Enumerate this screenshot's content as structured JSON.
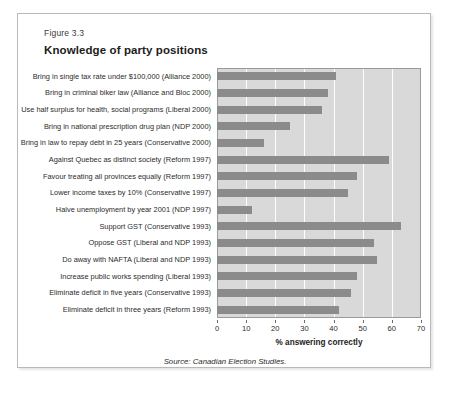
{
  "figure": {
    "number_label": "Figure 3.3",
    "title": "Knowledge of party positions",
    "source": "Source: Canadian Election Studies."
  },
  "colors": {
    "bar": "#8b8b8b",
    "plot_background": "#d9d9d9",
    "gridline": "#ffffff",
    "frame": "#9a9a9a",
    "card_border": "#b9b9b9",
    "text": "#231f20"
  },
  "chart_data": {
    "type": "bar",
    "orientation": "horizontal",
    "title": "Knowledge of party positions",
    "xlabel": "% answering correctly",
    "ylabel": "",
    "xlim": [
      0,
      70
    ],
    "xticks": [
      0,
      10,
      20,
      30,
      40,
      50,
      60,
      70
    ],
    "grid": true,
    "legend": null,
    "categories": [
      "Bring in single tax rate under $100,000 (Alliance 2000)",
      "Bring in criminal biker law (Alliance and Bloc 2000)",
      "Use half surplus for health, social programs (Liberal  2000)",
      "Bring in national prescription drug plan (NDP  2000)",
      "Bring in law to repay debt in 25 years (Conservative  2000)",
      "Against Quebec as distinct society (Reform 1997)",
      "Favour treating all provinces equally (Reform 1997)",
      "Lower income taxes by 10% (Conservative 1997)",
      "Halve unemployment by year 2001 (NDP 1997)",
      "Support GST (Conservative 1993)",
      "Oppose GST (Liberal and NDP 1993)",
      "Do away with NAFTA (Liberal and NDP 1993)",
      "Increase public works spending (Liberal 1993)",
      "Eliminate deficit in five years (Conservative 1993)",
      "Eliminate deficit in three years (Reform 1993)"
    ],
    "values": [
      41,
      38,
      36,
      25,
      16,
      59,
      48,
      45,
      12,
      63,
      54,
      55,
      48,
      46,
      42
    ]
  },
  "axis": {
    "tick_labels": [
      "0",
      "10",
      "20",
      "30",
      "40",
      "50",
      "60",
      "70"
    ],
    "title": "% answering correctly"
  }
}
